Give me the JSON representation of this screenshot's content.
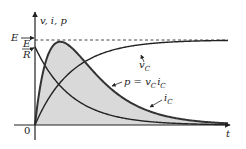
{
  "chart_data": {
    "type": "line",
    "title": "",
    "xlabel": "t",
    "ylabel": "v, i, p",
    "origin_label": "0",
    "y_markers": [
      {
        "name": "E",
        "label": "E",
        "value": 1.0,
        "style": "dashed-asymptote"
      },
      {
        "name": "E/R",
        "label_num": "E",
        "label_den": "R",
        "value": 0.92
      }
    ],
    "time_constant_units": 1.0,
    "x_range": [
      0,
      5.3
    ],
    "ylim": [
      0,
      1.25
    ],
    "series": [
      {
        "name": "vC",
        "label": "v",
        "label_sub": "C",
        "formula": "E*(1-exp(-t/tau))",
        "amplitude": 1.0
      },
      {
        "name": "iC",
        "label": "i",
        "label_sub": "C",
        "formula": "(E/R)*exp(-t/tau)",
        "amplitude": 0.92
      },
      {
        "name": "p",
        "label": "p = v",
        "label_sub": "C",
        "label_tail": "i",
        "label_tail_sub": "C",
        "formula": "vC*iC",
        "peak_value": 0.98,
        "shaded": true
      }
    ],
    "fill_color": "#d9d9d9",
    "line_color": "#222222"
  }
}
